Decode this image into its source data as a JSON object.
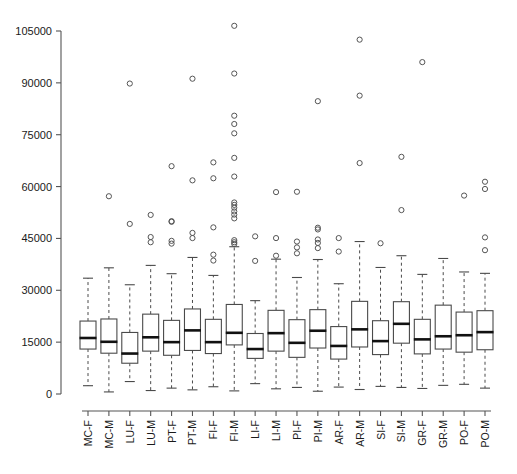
{
  "chart_data": {
    "type": "box",
    "title": "",
    "xlabel": "",
    "ylabel": "",
    "ylim": [
      0,
      108000
    ],
    "yticks": [
      0,
      15000,
      30000,
      45000,
      60000,
      75000,
      90000,
      105000
    ],
    "ytick_labels": [
      "0",
      "15000",
      "30000",
      "45000",
      "60000",
      "75000",
      "90000",
      "105000"
    ],
    "grid": false,
    "legend": null,
    "categories": [
      "MC-F",
      "MC-M",
      "LU-F",
      "LU-M",
      "PT-F",
      "PT-M",
      "FI-F",
      "FI-M",
      "LI-F",
      "LI-M",
      "PI-F",
      "PI-M",
      "AR-F",
      "AR-M",
      "SI-F",
      "SI-M",
      "GR-F",
      "GR-M",
      "PO-F",
      "PO-M"
    ],
    "boxes": [
      {
        "label": "MC-F",
        "whisker_low": 2400,
        "q1": 13000,
        "median": 16200,
        "q3": 21100,
        "whisker_high": 33500,
        "outliers": []
      },
      {
        "label": "MC-M",
        "whisker_low": 600,
        "q1": 11800,
        "median": 15100,
        "q3": 21700,
        "whisker_high": 36500,
        "outliers": [
          57200
        ]
      },
      {
        "label": "LU-F",
        "whisker_low": 3600,
        "q1": 8900,
        "median": 11700,
        "q3": 17800,
        "whisker_high": 31600,
        "outliers": [
          49200,
          89800
        ]
      },
      {
        "label": "LU-M",
        "whisker_low": 1000,
        "q1": 12400,
        "median": 16400,
        "q3": 23100,
        "whisker_high": 37200,
        "outliers": [
          51800,
          45400,
          43900
        ]
      },
      {
        "label": "PT-F",
        "whisker_low": 1700,
        "q1": 11200,
        "median": 15000,
        "q3": 21300,
        "whisker_high": 34800,
        "outliers": [
          50000,
          49800,
          44300,
          43500,
          65900
        ]
      },
      {
        "label": "PT-M",
        "whisker_low": 1200,
        "q1": 12600,
        "median": 18400,
        "q3": 24600,
        "whisker_high": 39500,
        "outliers": [
          91200,
          61800,
          46600,
          45100
        ]
      },
      {
        "label": "FI-F",
        "whisker_low": 2100,
        "q1": 11700,
        "median": 15000,
        "q3": 21600,
        "whisker_high": 34300,
        "outliers": [
          67000,
          62400,
          48200,
          40300,
          38600
        ]
      },
      {
        "label": "FI-M",
        "whisker_low": 900,
        "q1": 14200,
        "median": 17700,
        "q3": 25900,
        "whisker_high": 42600,
        "outliers": [
          106500,
          92700,
          80500,
          78100,
          75400,
          68300,
          62900,
          55400,
          54700,
          53900,
          52800,
          51900,
          50800,
          44500,
          43900,
          43400
        ]
      },
      {
        "label": "LI-F",
        "whisker_low": 3000,
        "q1": 10300,
        "median": 13000,
        "q3": 17500,
        "whisker_high": 27000,
        "outliers": [
          45600,
          38500
        ]
      },
      {
        "label": "LI-M",
        "whisker_low": 1500,
        "q1": 12400,
        "median": 17600,
        "q3": 24200,
        "whisker_high": 39000,
        "outliers": [
          58400,
          45100,
          40000
        ]
      },
      {
        "label": "PI-F",
        "whisker_low": 1900,
        "q1": 10600,
        "median": 14800,
        "q3": 21500,
        "whisker_high": 33700,
        "outliers": [
          58500,
          44100,
          42400,
          40700
        ]
      },
      {
        "label": "PI-M",
        "whisker_low": 800,
        "q1": 13300,
        "median": 18300,
        "q3": 24400,
        "whisker_high": 38900,
        "outliers": [
          84700,
          48100,
          47600,
          44700,
          43700,
          42200
        ]
      },
      {
        "label": "AR-F",
        "whisker_low": 2000,
        "q1": 10100,
        "median": 13900,
        "q3": 19500,
        "whisker_high": 31900,
        "outliers": [
          45100,
          41200
        ]
      },
      {
        "label": "AR-M",
        "whisker_low": 1300,
        "q1": 13600,
        "median": 18700,
        "q3": 26800,
        "whisker_high": 44100,
        "outliers": [
          102500,
          86300,
          66800
        ]
      },
      {
        "label": "SI-F",
        "whisker_low": 2200,
        "q1": 11400,
        "median": 15300,
        "q3": 21200,
        "whisker_high": 36600,
        "outliers": [
          43600
        ]
      },
      {
        "label": "SI-M",
        "whisker_low": 1900,
        "q1": 14700,
        "median": 20300,
        "q3": 26700,
        "whisker_high": 40000,
        "outliers": [
          68600,
          53200
        ]
      },
      {
        "label": "GR-F",
        "whisker_low": 1600,
        "q1": 11600,
        "median": 15800,
        "q3": 21600,
        "whisker_high": 34600,
        "outliers": [
          96000
        ]
      },
      {
        "label": "GR-M",
        "whisker_low": 2500,
        "q1": 13000,
        "median": 16700,
        "q3": 25700,
        "whisker_high": 39200,
        "outliers": []
      },
      {
        "label": "PO-F",
        "whisker_low": 2800,
        "q1": 12100,
        "median": 17000,
        "q3": 23700,
        "whisker_high": 35300,
        "outliers": [
          57400
        ]
      },
      {
        "label": "PO-M",
        "whisker_low": 1700,
        "q1": 12800,
        "median": 17900,
        "q3": 24100,
        "whisker_high": 34900,
        "outliers": [
          61400,
          59300,
          45300,
          41600
        ]
      }
    ]
  },
  "style": {
    "axis_color": "#555555",
    "box_stroke": "#4a4a4a",
    "median_color": "#111111",
    "outlier_stroke": "#555555",
    "background": "#ffffff"
  }
}
